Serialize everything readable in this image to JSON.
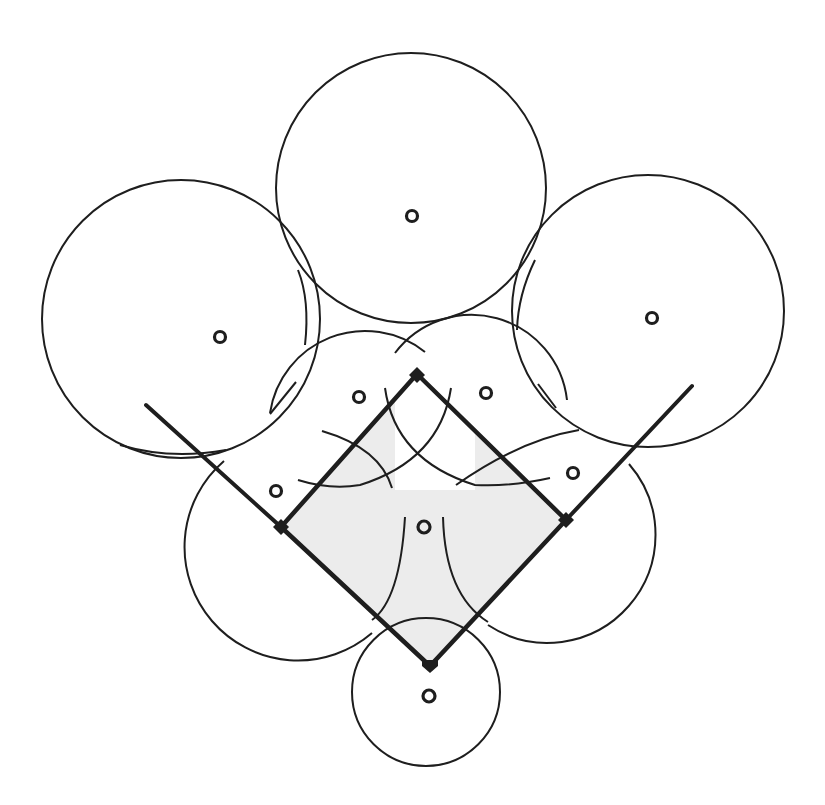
{
  "caption": {
    "text": "",
    "note": "partially cut-off caption line at top edge (only descenders visible)"
  },
  "diagram": {
    "colors": {
      "stroke": "#1e1e1e",
      "background": "#ffffff",
      "infield_shading": "#e6e6e6"
    },
    "bases": [
      {
        "name": "second-base",
        "x": 417,
        "y": 374
      },
      {
        "name": "first-base",
        "x": 566,
        "y": 520
      },
      {
        "name": "home-plate",
        "x": 430,
        "y": 666
      },
      {
        "name": "third-base",
        "x": 281,
        "y": 527
      }
    ],
    "foul_lines": [
      {
        "name": "left-foul-line",
        "x1": 146,
        "y1": 405,
        "x2": 430,
        "y2": 666
      },
      {
        "name": "right-foul-line",
        "x1": 692,
        "y1": 386,
        "x2": 430,
        "y2": 666
      }
    ],
    "players": [
      {
        "position": "center-fielder",
        "x": 412,
        "y": 216
      },
      {
        "position": "left-fielder",
        "x": 220,
        "y": 336
      },
      {
        "position": "right-fielder",
        "x": 652,
        "y": 318
      },
      {
        "position": "shortstop",
        "x": 359,
        "y": 397
      },
      {
        "position": "second-baseman",
        "x": 486,
        "y": 393
      },
      {
        "position": "third-baseman",
        "x": 276,
        "y": 490
      },
      {
        "position": "first-baseman",
        "x": 573,
        "y": 473
      },
      {
        "position": "pitcher",
        "x": 424,
        "y": 527
      },
      {
        "position": "catcher",
        "x": 429,
        "y": 697
      }
    ],
    "coverage_circles": [
      {
        "position": "center-fielder",
        "cx": 412,
        "cy": 188,
        "r": 136
      },
      {
        "position": "left-fielder",
        "cx": 181,
        "cy": 318,
        "r": 140
      },
      {
        "position": "right-fielder",
        "cx": 648,
        "cy": 310,
        "r": 136
      },
      {
        "position": "catcher",
        "cx": 426,
        "cy": 692,
        "r": 75
      }
    ]
  }
}
